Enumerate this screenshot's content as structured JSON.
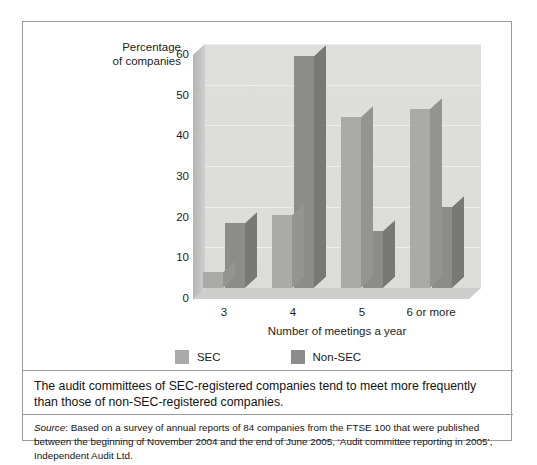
{
  "figure": {
    "caption": "The audit committees of SEC-registered companies tend to meet more frequently than those of non-SEC-registered companies.",
    "source_prefix": "Source",
    "source_text": ": Based on a survey of annual reports of 84 companies from the FTSE 100 that were published between the beginning of November 2004 and the end of June 2005, ‘Audit committee reporting in 2005’, Independent Audit Ltd."
  },
  "chart_data": {
    "type": "bar",
    "title": "",
    "xlabel": "Number of meetings a year",
    "ylabel": "Percentage of companies",
    "categories": [
      "3",
      "4",
      "5",
      "6 or more"
    ],
    "series": [
      {
        "name": "SEC",
        "color": "#aaaaa8",
        "values": [
          4,
          18,
          42,
          44
        ]
      },
      {
        "name": "Non-SEC",
        "color": "#8c8c8a",
        "values": [
          16,
          57,
          14,
          20
        ]
      }
    ],
    "ylim": [
      0,
      60
    ],
    "yticks": [
      0,
      10,
      20,
      30,
      40,
      50,
      60
    ],
    "ytick_labels": [
      "0",
      "10",
      "20",
      "30",
      "40",
      "50",
      "60"
    ],
    "grid": true,
    "legend_position": "bottom",
    "style": "3d-column"
  }
}
